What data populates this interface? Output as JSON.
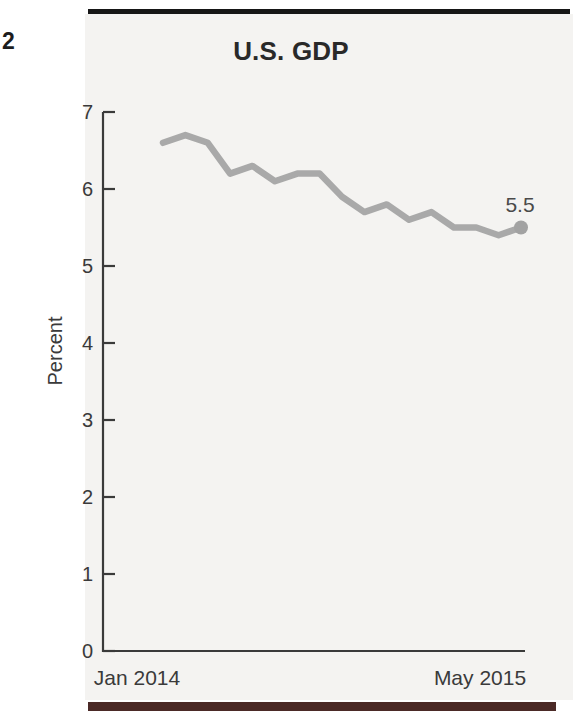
{
  "page": {
    "number": "2"
  },
  "figure": {
    "title": "U.S. GDP"
  },
  "chart_data": {
    "type": "line",
    "title": "U.S. GDP",
    "xlabel": "",
    "ylabel": "Percent",
    "ylim": [
      0,
      7
    ],
    "y_ticks": [
      0,
      1,
      2,
      3,
      4,
      5,
      6,
      7
    ],
    "x_axis": {
      "first_label": "Jan 2014",
      "last_label": "May 2015",
      "points": 17,
      "interval": "monthly"
    },
    "series": [
      {
        "name": "U.S. GDP (percent)",
        "values": [
          6.6,
          6.7,
          6.6,
          6.2,
          6.3,
          6.1,
          6.2,
          6.2,
          5.9,
          5.7,
          5.8,
          5.6,
          5.7,
          5.5,
          5.5,
          5.4,
          5.5
        ]
      }
    ],
    "end_annotation": "5.5",
    "grid": false,
    "legend": false,
    "colors": {
      "line": "#a9a9a9",
      "end_dot": "#a2a2a2",
      "axis": "#3a3a3a",
      "tick_label": "#3a3a3a",
      "annotation": "#4a4a4a"
    }
  }
}
